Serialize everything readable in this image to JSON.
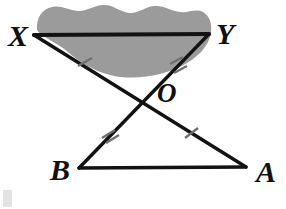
{
  "figure": {
    "background_color": "#ffffff",
    "line_color": "#121212",
    "tick_color": "#6f6f6f",
    "shaded_region_color": "#9b9b9b",
    "label_color": "#101010"
  },
  "labels": {
    "x": "X",
    "y": "Y",
    "o": "O",
    "b": "B",
    "a": "A"
  },
  "points": {
    "X": {
      "x": 34,
      "y": 35
    },
    "Y": {
      "x": 209,
      "y": 34
    },
    "O": {
      "x": 142,
      "y": 102
    },
    "B": {
      "x": 79,
      "y": 168
    },
    "A": {
      "x": 246,
      "y": 167
    }
  },
  "label_positions": {
    "X": {
      "x": 8,
      "y": 46
    },
    "Y": {
      "x": 216,
      "y": 44
    },
    "O": {
      "x": 157,
      "y": 102
    },
    "B": {
      "x": 50,
      "y": 180
    },
    "A": {
      "x": 256,
      "y": 182
    }
  },
  "segments": [
    {
      "name": "XY",
      "from": "X",
      "to": "Y",
      "weight": "heavy",
      "ticks": 0
    },
    {
      "name": "XA",
      "from": "X",
      "to": "A",
      "weight": "med",
      "ticks": 0
    },
    {
      "name": "YB",
      "from": "Y",
      "to": "B",
      "weight": "med",
      "ticks": 0
    },
    {
      "name": "BA",
      "from": "B",
      "to": "A",
      "weight": "med",
      "ticks": 0
    }
  ],
  "tick_marks": [
    {
      "name": "tick-XO",
      "segment": "XO",
      "count": 1,
      "x": 85,
      "y": 62
    },
    {
      "name": "tick-YO",
      "segment": "YO",
      "count": 2,
      "x": 178,
      "y": 66
    },
    {
      "name": "tick-OB",
      "segment": "OB",
      "count": 2,
      "x": 110,
      "y": 135
    },
    {
      "name": "tick-OA",
      "segment": "OA",
      "count": 1,
      "x": 191,
      "y": 133
    }
  ],
  "shaded_region": {
    "name": "shaded-blob",
    "description": "Irregular wavy gray blob above and below segment XY",
    "color": "#9b9b9b"
  },
  "corner_mark": {
    "name": "page-corner-mark",
    "color": "#e3e3e3",
    "x": 3,
    "y": 190,
    "width": 9,
    "height": 17
  }
}
